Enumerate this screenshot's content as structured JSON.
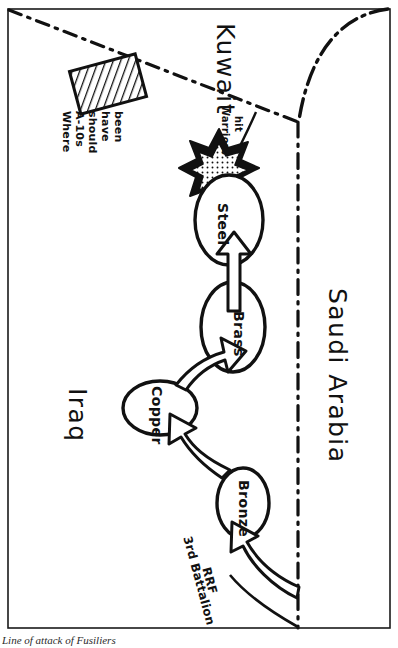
{
  "figure": {
    "caption": "Line of attack of Fusiliers",
    "orientation_note": "map labels rotated 90 degrees clockwise"
  },
  "map": {
    "countries": [
      {
        "name": "Iraq"
      },
      {
        "name": "Kuwait"
      },
      {
        "name": "Saudi Arabia"
      }
    ],
    "objectives": [
      {
        "name": "Bronze"
      },
      {
        "name": "Copper"
      },
      {
        "name": "Brass"
      },
      {
        "name": "Steel"
      }
    ],
    "annotations": [
      {
        "id": "a10-note",
        "lines": [
          "Where",
          "A-10s",
          "should",
          "have",
          "been"
        ]
      },
      {
        "id": "warriors-hit",
        "lines": [
          "Warriors",
          "hit"
        ]
      },
      {
        "id": "attacking-unit",
        "lines": [
          "3rd Battalion",
          "RRF"
        ]
      }
    ],
    "legend_shapes": [
      {
        "id": "hatched-box",
        "meaning": "Where A-10s should have been"
      },
      {
        "id": "burst-star",
        "meaning": "Warriors hit"
      },
      {
        "id": "block-arrow",
        "meaning": "axis of advance"
      },
      {
        "id": "dash-dot-line",
        "meaning": "international border"
      }
    ],
    "colors": {
      "ink": "#111111",
      "paper": "#ffffff",
      "caption": "#2b2b2b"
    }
  }
}
